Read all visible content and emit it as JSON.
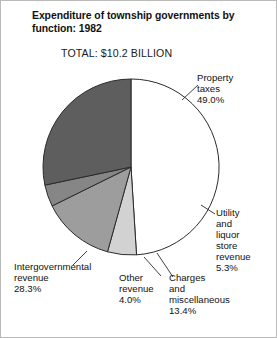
{
  "figure": {
    "title": "Expenditure of township governments\nby function: 1982",
    "total": "TOTAL:  $10.2 BILLION"
  },
  "labels": {
    "property": "Property\ntaxes\n49.0%",
    "utility": "Utility\nand\nliquor\nstore\nrevenue\n5.3%",
    "charges": "Charges\nand\nmiscellaneous\n13.4%",
    "other": "Other\nrevenue\n4.0%",
    "intergov": "Intergovernmental\nrevenue\n28.3%"
  },
  "chart_data": {
    "type": "pie",
    "title": "Expenditure of township governments by function: 1982",
    "subtitle": "TOTAL:  $10.2 BILLION",
    "units": "percent of total",
    "total_label": "$10.2 BILLION",
    "start_angle_deg": 0,
    "direction": "clockwise",
    "categories": [
      "Property taxes",
      "Utility and liquor store revenue",
      "Charges and miscellaneous",
      "Other revenue",
      "Intergovernmental revenue"
    ],
    "values": [
      49.0,
      5.3,
      13.4,
      4.0,
      28.3
    ],
    "value_labels": [
      "49.0%",
      "5.3%",
      "13.4%",
      "4.0%",
      "28.3%"
    ],
    "colors": [
      "#ffffff",
      "#d2d2d2",
      "#9d9d9d",
      "#868686",
      "#5e5e5e"
    ],
    "slice_edge_color": "#2b2b2b",
    "legend": "none",
    "labels_position": "outside-with-leader-lines"
  },
  "geometry": {
    "center_x": 130,
    "center_y": 166,
    "radius": 88
  }
}
